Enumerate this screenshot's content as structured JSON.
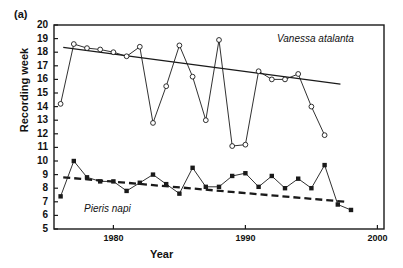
{
  "panel": {
    "letter": "(a)"
  },
  "axes": {
    "ylabel": "Recording week",
    "xlabel": "Year",
    "yticks": [
      20,
      19,
      18,
      17,
      16,
      15,
      14,
      13,
      12,
      11,
      10,
      9,
      8,
      7,
      6,
      5
    ],
    "xticks": [
      1980,
      1990,
      2000
    ],
    "ylim": [
      5,
      20
    ],
    "xlim": [
      1975.5,
      2000.5
    ]
  },
  "annotations": {
    "vanessa": "Vanessa atalanta",
    "pieris": "Pieris napi"
  },
  "colors": {
    "axis": "#1a1a1a",
    "series": "#1a1a1a",
    "text": "#111111"
  },
  "chart_data": {
    "type": "line",
    "title": "",
    "subtitle": "",
    "xlabel": "Year",
    "ylabel": "Recording week",
    "xlim": [
      1975.5,
      2000.5
    ],
    "ylim": [
      5,
      20
    ],
    "grid": false,
    "legend": "none (in-plot italic species labels)",
    "annotations": [
      "(a)",
      "Vanessa atalanta",
      "Pieris napi"
    ],
    "x": [
      1976,
      1977,
      1978,
      1979,
      1980,
      1981,
      1982,
      1983,
      1984,
      1985,
      1986,
      1987,
      1988,
      1989,
      1990,
      1991,
      1992,
      1993,
      1994,
      1995,
      1996,
      1997,
      1998
    ],
    "series": [
      {
        "name": "Vanessa atalanta",
        "marker": "open-circle",
        "line": "solid",
        "values": [
          14.2,
          18.6,
          18.3,
          18.2,
          18.0,
          17.7,
          18.4,
          12.8,
          15.5,
          18.5,
          16.2,
          13.0,
          18.9,
          11.1,
          11.2,
          16.6,
          16.0,
          16.0,
          16.4,
          14.0,
          11.9,
          null,
          null
        ]
      },
      {
        "name": "Pieris napi",
        "marker": "filled-square",
        "line": "solid",
        "values": [
          7.4,
          10.0,
          8.8,
          8.5,
          8.5,
          7.8,
          8.4,
          9.0,
          8.3,
          7.6,
          9.5,
          8.1,
          8.1,
          8.9,
          9.1,
          8.1,
          8.9,
          8.0,
          8.7,
          8.0,
          9.7,
          6.8,
          6.4
        ]
      }
    ],
    "trend_lines": [
      {
        "name": "Vanessa atalanta trend",
        "style": "solid",
        "x": [
          1976.2,
          1997.2
        ],
        "y": [
          18.35,
          15.65
        ]
      },
      {
        "name": "Pieris napi trend",
        "style": "dashed",
        "x": [
          1976.2,
          1997.6
        ],
        "y": [
          8.8,
          7.0
        ]
      }
    ]
  }
}
